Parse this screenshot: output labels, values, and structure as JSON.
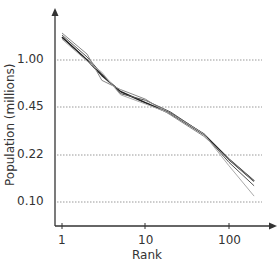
{
  "chart_data": {
    "type": "line",
    "title": "",
    "xlabel": "Rank",
    "ylabel": "Population (millions)",
    "x_scale": "log",
    "y_scale": "log",
    "x_ticks": [
      "1",
      "10",
      "100"
    ],
    "y_ticks": [
      "1.00",
      "0.45",
      "0.22",
      "0.10"
    ],
    "grid": {
      "horizontal": true,
      "style": "dotted"
    },
    "legend": null,
    "series": [
      {
        "name": "series-1",
        "color": "#222222",
        "x": [
          1,
          2,
          3,
          5,
          10,
          20,
          50,
          100,
          200
        ],
        "y": [
          1.45,
          1.0,
          0.78,
          0.6,
          0.5,
          0.42,
          0.3,
          0.2,
          0.14
        ]
      },
      {
        "name": "series-2",
        "color": "#555555",
        "x": [
          1,
          2,
          3,
          5,
          10,
          20,
          50,
          100,
          200
        ],
        "y": [
          1.5,
          1.05,
          0.8,
          0.58,
          0.52,
          0.43,
          0.3,
          0.19,
          0.13
        ]
      },
      {
        "name": "series-3",
        "color": "#888888",
        "x": [
          1,
          2,
          3,
          5,
          10,
          20,
          50,
          100,
          200
        ],
        "y": [
          1.55,
          1.1,
          0.72,
          0.62,
          0.53,
          0.41,
          0.29,
          0.2,
          0.14
        ]
      },
      {
        "name": "series-4",
        "color": "#aaaaaa",
        "x": [
          1,
          2,
          3,
          5,
          10,
          20,
          50,
          100,
          200
        ],
        "y": [
          1.4,
          0.98,
          0.82,
          0.57,
          0.49,
          0.42,
          0.3,
          0.18,
          0.11
        ]
      }
    ]
  },
  "labels": {
    "xlabel": "Rank",
    "ylabel": "Population (millions)",
    "x_ticks": [
      {
        "label": "1",
        "x": 62
      },
      {
        "label": "10",
        "x": 145
      },
      {
        "label": "100",
        "x": 229
      }
    ],
    "y_ticks": [
      {
        "label": "1.00",
        "y": 60
      },
      {
        "label": "0.45",
        "y": 107
      },
      {
        "label": "0.22",
        "y": 155
      },
      {
        "label": "0.10",
        "y": 202
      }
    ]
  }
}
